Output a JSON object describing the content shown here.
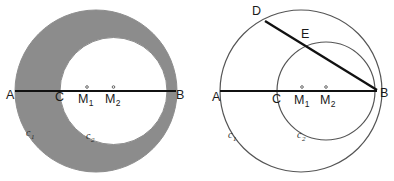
{
  "figure": {
    "width": 394,
    "height": 181,
    "background": "#ffffff"
  },
  "colors": {
    "stroke": "#555555",
    "line": "#111111",
    "shade": "#8c8c8c",
    "label": "#1a1a1a",
    "circle_label": "#2b2b2b",
    "white": "#ffffff"
  },
  "panels": [
    {
      "id": "left",
      "name": "shaded-lune-panel",
      "shaded": true,
      "circles": [
        {
          "name": "c1",
          "label": "c",
          "sub": "1",
          "cx": 96,
          "cy": 91,
          "r": 81,
          "label_x": 26,
          "label_y": 136
        },
        {
          "name": "c2",
          "label": "c",
          "sub": "2",
          "cx": 113.5,
          "cy": 91,
          "r": 53.5,
          "label_x": 86,
          "label_y": 139
        }
      ],
      "segments": [
        {
          "name": "segment-AB",
          "x1": 15,
          "y1": 91,
          "x2": 176,
          "y2": 91,
          "width": 2.1
        }
      ],
      "points": [
        {
          "name": "A",
          "label": "A",
          "sub": "",
          "x": 15,
          "y": 91,
          "label_x": 6,
          "label_y": 99,
          "dot": false
        },
        {
          "name": "C",
          "label": "C",
          "sub": "",
          "x": 60,
          "y": 91,
          "label_x": 55,
          "label_y": 101,
          "dot": false
        },
        {
          "name": "M1",
          "label": "M",
          "sub": "1",
          "x": 87,
          "y": 91,
          "label_x": 78,
          "label_y": 103,
          "dot": true
        },
        {
          "name": "M2",
          "label": "M",
          "sub": "2",
          "x": 113.5,
          "y": 91,
          "label_x": 105,
          "label_y": 103,
          "dot": true
        },
        {
          "name": "B",
          "label": "B",
          "sub": "",
          "x": 167,
          "y": 91,
          "label_x": 176,
          "label_y": 99,
          "dot": false
        }
      ]
    },
    {
      "id": "right",
      "name": "chord-construction-panel",
      "shaded": false,
      "circles": [
        {
          "name": "c1",
          "label": "c",
          "sub": "1",
          "cx": 301,
          "cy": 91,
          "r": 81,
          "label_x": 228,
          "label_y": 138
        },
        {
          "name": "c2",
          "label": "c",
          "sub": "2",
          "cx": 326,
          "cy": 91,
          "r": 49,
          "label_x": 297,
          "label_y": 138
        }
      ],
      "segments": [
        {
          "name": "segment-AB",
          "x1": 220,
          "y1": 91,
          "x2": 377,
          "y2": 91,
          "width": 2.1
        },
        {
          "name": "segment-DB",
          "x1": 265,
          "y1": 21,
          "x2": 377,
          "y2": 90,
          "width": 2.3
        }
      ],
      "points": [
        {
          "name": "A",
          "label": "A",
          "sub": "",
          "x": 221,
          "y": 91,
          "label_x": 212,
          "label_y": 101,
          "dot": false
        },
        {
          "name": "C",
          "label": "C",
          "sub": "",
          "x": 277,
          "y": 91,
          "label_x": 272,
          "label_y": 103,
          "dot": false
        },
        {
          "name": "M1",
          "label": "M",
          "sub": "1",
          "x": 302,
          "y": 91,
          "label_x": 294,
          "label_y": 104,
          "dot": true
        },
        {
          "name": "M2",
          "label": "M",
          "sub": "2",
          "x": 326,
          "y": 91,
          "label_x": 320,
          "label_y": 104,
          "dot": true
        },
        {
          "name": "B",
          "label": "B",
          "sub": "",
          "x": 375,
          "y": 91,
          "label_x": 380,
          "label_y": 97,
          "dot": false
        },
        {
          "name": "D",
          "label": "D",
          "sub": "",
          "x": 265,
          "y": 21,
          "label_x": 252,
          "label_y": 15,
          "dot": false
        },
        {
          "name": "E",
          "label": "E",
          "sub": "",
          "x": 308,
          "y": 46,
          "label_x": 301,
          "label_y": 38,
          "dot": false
        }
      ]
    }
  ]
}
